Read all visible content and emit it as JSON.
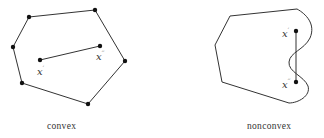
{
  "convex": {
    "caption": "convex",
    "point1_label": "x",
    "point1_mark": "′",
    "point2_label": "x",
    "point2_mark": "′′"
  },
  "nonconvex": {
    "caption": "nonconvex",
    "point1_label": "x",
    "point1_mark": "′",
    "point2_label": "x",
    "point2_mark": "′′"
  },
  "colors": {
    "stroke": "#333333",
    "vertex": "#111111"
  }
}
